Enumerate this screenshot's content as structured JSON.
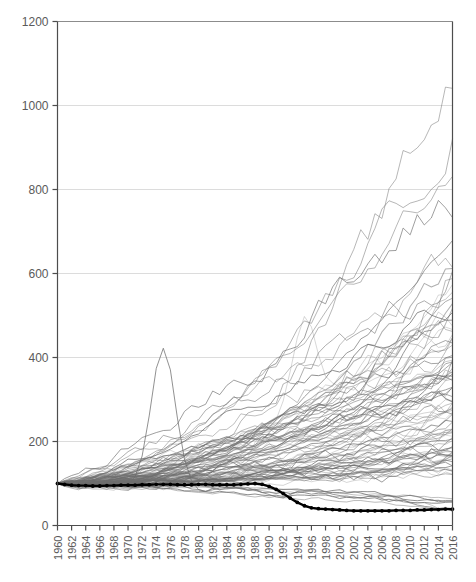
{
  "chart_data": {
    "type": "line",
    "title": "",
    "subtitle": "",
    "xlabel": "",
    "ylabel": "",
    "xlim": [
      1960,
      2016
    ],
    "ylim": [
      0,
      1200
    ],
    "grid": true,
    "legend_position": "none",
    "y_ticks": [
      0,
      200,
      400,
      600,
      800,
      1000,
      1200
    ],
    "y_tick_labels": [
      "0",
      "200",
      "400",
      "600",
      "800",
      "1000",
      "1200"
    ],
    "x_ticks": [
      1960,
      1962,
      1964,
      1966,
      1968,
      1970,
      1972,
      1974,
      1976,
      1978,
      1980,
      1982,
      1984,
      1986,
      1988,
      1990,
      1992,
      1994,
      1996,
      1998,
      2000,
      2002,
      2004,
      2006,
      2008,
      2010,
      2012,
      2014,
      2016
    ],
    "x_tick_labels": [
      "1960",
      "1962",
      "1964",
      "1966",
      "1968",
      "1970",
      "1972",
      "1974",
      "1976",
      "1978",
      "1980",
      "1982",
      "1984",
      "1986",
      "1988",
      "1990",
      "1992",
      "1994",
      "1996",
      "1998",
      "2000",
      "2002",
      "2004",
      "2006",
      "2008",
      "2010",
      "2012",
      "2014",
      "2016"
    ],
    "x_tick_label_rotation": -90,
    "note": "Index-normalized spaghetti plot: all series start at 100 in 1960. One highlighted series drawn in bold black with round point markers.",
    "series_colors": {
      "background": "#6e6e6e",
      "highlight": "#000000",
      "grid": "#dcdcdc",
      "axis": "#4d4d4d"
    },
    "highlight_series": {
      "name": "highlighted",
      "style": "bold-black-with-markers",
      "x": [
        1960,
        1961,
        1962,
        1963,
        1964,
        1965,
        1966,
        1967,
        1968,
        1969,
        1970,
        1971,
        1972,
        1973,
        1974,
        1975,
        1976,
        1977,
        1978,
        1979,
        1980,
        1981,
        1982,
        1983,
        1984,
        1985,
        1986,
        1987,
        1988,
        1989,
        1990,
        1991,
        1992,
        1993,
        1994,
        1995,
        1996,
        1997,
        1998,
        1999,
        2000,
        2001,
        2002,
        2003,
        2004,
        2005,
        2006,
        2007,
        2008,
        2009,
        2010,
        2011,
        2012,
        2013,
        2014,
        2015,
        2016
      ],
      "y": [
        100,
        98,
        96,
        95,
        95,
        94,
        94,
        95,
        95,
        96,
        96,
        96,
        97,
        97,
        98,
        98,
        98,
        97,
        97,
        97,
        98,
        98,
        97,
        97,
        97,
        97,
        98,
        99,
        100,
        98,
        93,
        86,
        76,
        65,
        55,
        47,
        42,
        40,
        39,
        38,
        37,
        36,
        35,
        35,
        35,
        35,
        35,
        35,
        36,
        36,
        36,
        37,
        37,
        38,
        38,
        39,
        39
      ]
    },
    "background_series_summary": {
      "count": 90,
      "start_value": 100,
      "start_year": 1960,
      "end_year": 2016,
      "end_value_range": [
        30,
        1075
      ],
      "max_value": 1075,
      "median_end_value": 250,
      "notable_features": [
        "One series spikes to about 445 around 1975 then falls back below 150",
        "One series peaks near 640 in 1995, dips to about 490 in 1997, then rises to about 1075 by 2016",
        "Dense band between about 150 and 250 from 1980 to 2000",
        "Heavy spread after 1995 with most series between 150 and 500 at 2016"
      ]
    }
  }
}
